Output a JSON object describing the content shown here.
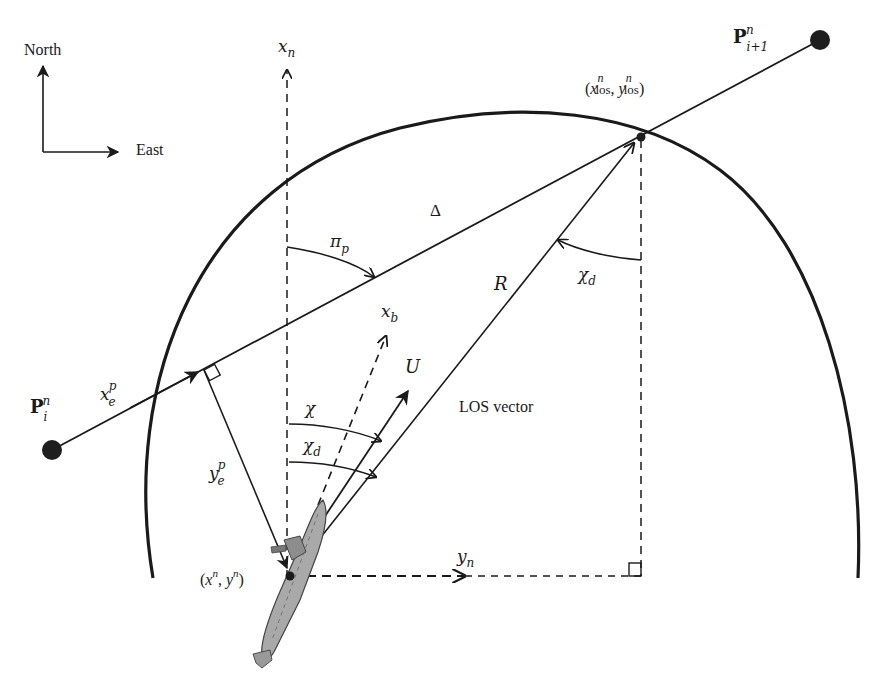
{
  "figure": {
    "compass": {
      "north_label": "North",
      "east_label": "East"
    },
    "waypoints": {
      "start": {
        "label": "P",
        "sub": "i",
        "sup": "n"
      },
      "end": {
        "label": "P",
        "sub": "i+1",
        "sup": "n"
      }
    },
    "los_point": {
      "open": "(",
      "x": "x",
      "y": "y",
      "sub": "los",
      "sup": "n",
      "close": ")",
      "comma": ","
    },
    "vehicle_position": {
      "text_x": "x",
      "text_y": "y",
      "sup": "n"
    },
    "axes": {
      "north_axis": {
        "base": "x",
        "sub": "n"
      },
      "east_axis": {
        "base": "y",
        "sub": "n"
      },
      "body_axis": {
        "base": "x",
        "sub": "b"
      }
    },
    "labels": {
      "delta": "Δ",
      "radius": "R",
      "speed": "U",
      "los_vector": "LOS vector",
      "path_angle": {
        "base": "π",
        "sub": "p"
      },
      "course": "χ",
      "desired_course": {
        "base": "χ",
        "sub": "d"
      },
      "desired_course_top": {
        "base": "χ",
        "sub": "d"
      },
      "along_track": {
        "base": "x",
        "sub": "e",
        "sup": "p"
      },
      "cross_track": {
        "base": "y",
        "sub": "e",
        "sup": "p"
      }
    },
    "colors": {
      "line": "#1a1a1a",
      "waypoint": "#1e1e1e",
      "vessel_fill": "#a9a9a9",
      "vessel_stroke": "#444444"
    }
  }
}
